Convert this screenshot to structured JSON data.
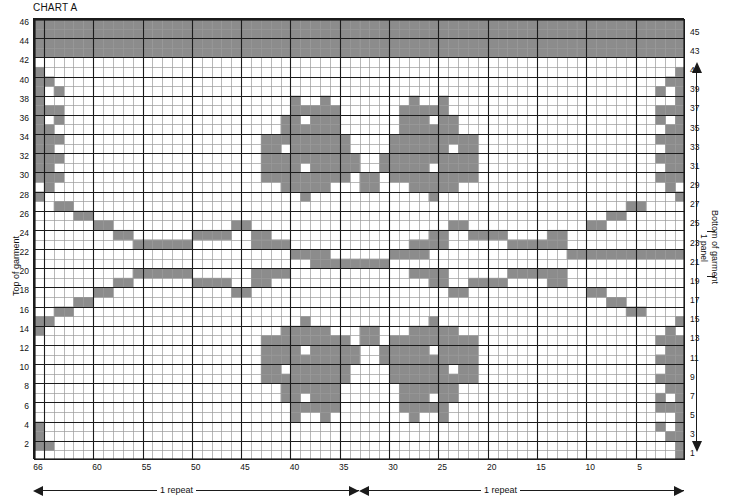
{
  "title": "CHART A",
  "colors": {
    "filled": "#8c8c8c",
    "empty": "#ffffff",
    "grid_minor": "#9a9a9a",
    "grid_major": "#1b1b1b",
    "text": "#111111"
  },
  "axes": {
    "left_caption": "Top of garment",
    "right_caption": "Bottom of garment",
    "panel_caption": "1 panel",
    "row_numbers_left": [
      46,
      44,
      42,
      40,
      38,
      36,
      34,
      32,
      30,
      28,
      26,
      24,
      22,
      20,
      18,
      16,
      14,
      12,
      10,
      8,
      6,
      4,
      2
    ],
    "row_numbers_right": [
      45,
      43,
      41,
      39,
      37,
      35,
      33,
      31,
      29,
      27,
      25,
      23,
      21,
      19,
      17,
      15,
      13,
      11,
      9,
      7,
      5,
      3,
      1
    ],
    "column_numbers": [
      66,
      60,
      55,
      50,
      45,
      40,
      35,
      30,
      25,
      20,
      15,
      10,
      5
    ],
    "rows_total": 46,
    "columns_total": 66
  },
  "repeats": [
    {
      "label": "1 repeat",
      "direction": "left"
    },
    {
      "label": "1 repeat",
      "direction": "right"
    }
  ],
  "chart_data": {
    "type": "heatmap",
    "title": "CHART A",
    "xlabel": "",
    "ylabel": "",
    "legend": [],
    "grid": true,
    "value_labels": {
      "0": "background (main colour)",
      "1": "shaded (contrast colour)"
    },
    "rows": [
      {
        "row": 46,
        "cells": "111111111111111111111111111111111111111111111111111111111111111111"
      },
      {
        "row": 45,
        "cells": "111111111111111111111111111111111111111111111111111111111111111111"
      },
      {
        "row": 44,
        "cells": "111111111111111111111111111111111111111111111111111111111111111111"
      },
      {
        "row": 43,
        "cells": "111111111111111111111111111111111111111111111111111111111111111111"
      },
      {
        "row": 42,
        "cells": "000000000000000000000000000000000000000000000000000000000000000000"
      },
      {
        "row": 41,
        "cells": "100000000000000000000000000000000000000000000000000000000000000001"
      },
      {
        "row": 40,
        "cells": "110000000000000000000000000000000000000000000000000000000000000011"
      },
      {
        "row": 39,
        "cells": "101000000000000000000000000000000000000000000000000000000000000101"
      },
      {
        "row": 38,
        "cells": "100000000000000000000000001001000000001001000000000000000000000001"
      },
      {
        "row": 37,
        "cells": "111000000000000000000000001111100000011111000000000000000000000111"
      },
      {
        "row": 36,
        "cells": "101000000000000000000000011011100000011101100000000000000000000101"
      },
      {
        "row": 35,
        "cells": "110000000000000000000000011111100000011111100000000000000000000011"
      },
      {
        "row": 34,
        "cells": "111000000000000000000001111111110000111111111000000000000000000111"
      },
      {
        "row": 33,
        "cells": "110000000000000000000001101111110000111111011000000000000000000011"
      },
      {
        "row": 32,
        "cells": "111000000000000000000001111111111001111111111000000000000000000111"
      },
      {
        "row": 31,
        "cells": "110000000000000000000001111011111001111101111000000000000000000011"
      },
      {
        "row": 30,
        "cells": "111000000000000000000001111111110110111111111000000000000000000111"
      },
      {
        "row": 29,
        "cells": "010000000000000000000000011111000110001111100000000000000000000010"
      },
      {
        "row": 28,
        "cells": "100000000000000000000000000100000000000010000000000000000000000001"
      },
      {
        "row": 27,
        "cells": "001100000000000000000000000000000000000000000000000000000000110000"
      },
      {
        "row": 26,
        "cells": "000011000000000000000000000000000000000000000000000000000011000000"
      },
      {
        "row": 25,
        "cells": "000000110000000000001100000000000000000000110000000000001100000000"
      },
      {
        "row": 24,
        "cells": "000000001100000011110011000000000000000011001111000011000000000000"
      },
      {
        "row": 23,
        "cells": "000000000011111100000011110000000000001111000000111111000000000000"
      },
      {
        "row": 22,
        "cells": "000000000000000000000000001111000000111100000000000000111111111111"
      },
      {
        "row": 21,
        "cells": "000000000000000000000000000011111111000000000000000000000000000000"
      },
      {
        "row": 20,
        "cells": "000000000011111100000011110000000000001111000000111111000000000000"
      },
      {
        "row": 19,
        "cells": "000000001100000011110011000000000000000011001111000011000000000000"
      },
      {
        "row": 18,
        "cells": "000000110000000000001100000000000000000000110000000000001100000000"
      },
      {
        "row": 17,
        "cells": "000011000000000000000000000000000000000000000000000000000011000000"
      },
      {
        "row": 16,
        "cells": "001100000000000000000000000000000000000000000000000000000000110000"
      },
      {
        "row": 15,
        "cells": "110000000000000000000000000100000000000010000000000000000000000001"
      },
      {
        "row": 14,
        "cells": "100000000000000000000000011111000110001111100000000000000000000010"
      },
      {
        "row": 13,
        "cells": "000000000000000000000001111111110110111111111000000000000000000111"
      },
      {
        "row": 12,
        "cells": "000000000000000000000001111011111001111101111000000000000000000011"
      },
      {
        "row": 11,
        "cells": "000000000000000000000001111111111001111111111000000000000000000111"
      },
      {
        "row": 10,
        "cells": "000000000000000000000001101111110000111111011000000000000000000011"
      },
      {
        "row": 9,
        "cells": "000000000000000000000001111111110000111111111000000000000000000111"
      },
      {
        "row": 8,
        "cells": "000000000000000000000000011111100000011111100000000000000000000011"
      },
      {
        "row": 7,
        "cells": "000000000000000000000000011011100000011101100000000000000000000101"
      },
      {
        "row": 6,
        "cells": "000000000000000000000000001111100000011111000000000000000000000111"
      },
      {
        "row": 5,
        "cells": "000000000000000000000000001001000000001001000000000000000000000001"
      },
      {
        "row": 4,
        "cells": "100000000000000000000000000000000000000000000000000000000000000101"
      },
      {
        "row": 3,
        "cells": "100000000000000000000000000000000000000000000000000000000000000011"
      },
      {
        "row": 2,
        "cells": "110000000000000000000000000000000000000000000000000000000000000001"
      },
      {
        "row": 1,
        "cells": "000000000000000000000000000000000000000000000000000000000000000001"
      }
    ]
  }
}
